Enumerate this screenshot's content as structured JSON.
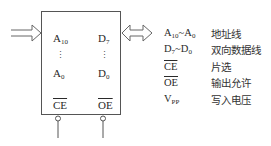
{
  "chip": {
    "pins": {
      "addr_high": {
        "base": "A",
        "sub": "10"
      },
      "addr_low": {
        "base": "A",
        "sub": "0"
      },
      "data_high": {
        "base": "D",
        "sub": "7"
      },
      "data_low": {
        "base": "D",
        "sub": "0"
      },
      "chip_enable": "CE",
      "output_enable": "OE"
    },
    "ellipsis": "⋮"
  },
  "legend": {
    "rows": [
      {
        "sym_a": "A",
        "sub_a": "10",
        "sep": "~",
        "sym_b": "A",
        "sub_b": "0",
        "desc": "地址线"
      },
      {
        "sym_a": "D",
        "sub_a": "7",
        "sep": "~",
        "sym_b": "D",
        "sub_b": "0",
        "desc": "双向数据线"
      },
      {
        "sym": "CE",
        "overline": true,
        "desc": "片选"
      },
      {
        "sym": "OE",
        "overline": true,
        "desc": "输出允许"
      },
      {
        "sym_a": "V",
        "sub_a": "PP",
        "desc": "写入电压"
      }
    ]
  },
  "colors": {
    "line": "#555555",
    "text": "#2a2a2a"
  }
}
